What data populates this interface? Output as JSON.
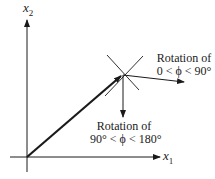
{
  "diagram": {
    "axes": {
      "x_label": "x",
      "x_sub": "1",
      "y_label": "x",
      "y_sub": "2"
    },
    "annotations": {
      "rot_small_line1": "Rotation of",
      "rot_small_line2": "0 < ϕ < 90°",
      "rot_large_line1": "Rotation of",
      "rot_large_line2": "90° < ϕ < 180°"
    },
    "colors": {
      "stroke": "#1a1a1a",
      "background": "#ffffff"
    }
  }
}
